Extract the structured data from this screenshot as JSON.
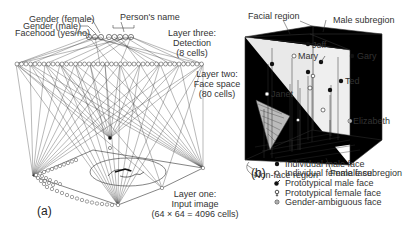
{
  "panel_a": {
    "label": "(a)",
    "top_labels": {
      "gender_female": "Gender (female)",
      "gender_male": "Gender (male)",
      "facehood": "Facehood (yes/no)",
      "persons_name": "Person's name"
    },
    "layer_three": {
      "line1": "Layer three:",
      "line2": "Detection",
      "line3": "(8 cells)"
    },
    "layer_two": {
      "line1": "Layer two:",
      "line2": "Face space",
      "line3": "(80 cells)"
    },
    "layer_one": {
      "line1": "Layer one:",
      "line2": "Input image",
      "line3": "(64 × 64 = 4096 cells)"
    }
  },
  "panel_b": {
    "label": "(b)",
    "region_labels": {
      "facial_region": "Facial region",
      "male_subregion": "Male subregion",
      "non_face_region": "Non-face region",
      "female_subregion": "Female subregion"
    },
    "points": [
      {
        "name": "Jeff",
        "type": "individual-male"
      },
      {
        "name": "Mary",
        "type": "individual-female"
      },
      {
        "name": "Gary",
        "type": "individual-male"
      },
      {
        "name": "Ted",
        "type": "individual-male"
      },
      {
        "name": "Janet",
        "type": "individual-female"
      },
      {
        "name": "Elizabeth",
        "type": "gender-ambiguous"
      }
    ],
    "legend": [
      {
        "symbol": "filled-dot",
        "label": "Individual male face"
      },
      {
        "symbol": "open-dot",
        "label": "Individual female face"
      },
      {
        "symbol": "male-symbol",
        "label": "Prototypical male face"
      },
      {
        "symbol": "female-symbol",
        "label": "Prototypical female face"
      },
      {
        "symbol": "dotted-dot",
        "label": "Gender-ambiguous face"
      }
    ]
  }
}
